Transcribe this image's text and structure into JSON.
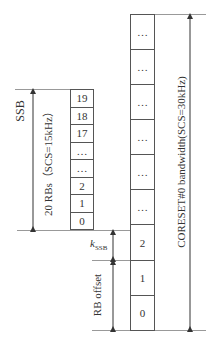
{
  "ssb": {
    "label": "SSB",
    "span_label": "20 RBs（SCS=15kHz）",
    "rbs": [
      "19",
      "18",
      "17",
      "…",
      "…",
      "2",
      "1",
      "0"
    ]
  },
  "coreset": {
    "span_label": "CORESET#0 bandwidth(SCS=30kHz)",
    "rbs": [
      "…",
      "…",
      "…",
      "…",
      "…",
      "…",
      "2",
      "1",
      "0"
    ]
  },
  "offsets": {
    "kssb_label": "k",
    "kssb_sub": "SSB",
    "rb_offset_label": "RB offset"
  }
}
